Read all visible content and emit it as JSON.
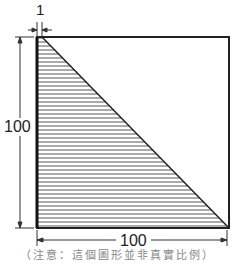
{
  "figure": {
    "dimensions": {
      "top_offset": "1",
      "height": "100",
      "width": "100"
    },
    "note": "（注意：這個圖形並非真實比例）",
    "colors": {
      "outline": "#222222",
      "hatch": "#555555"
    }
  }
}
